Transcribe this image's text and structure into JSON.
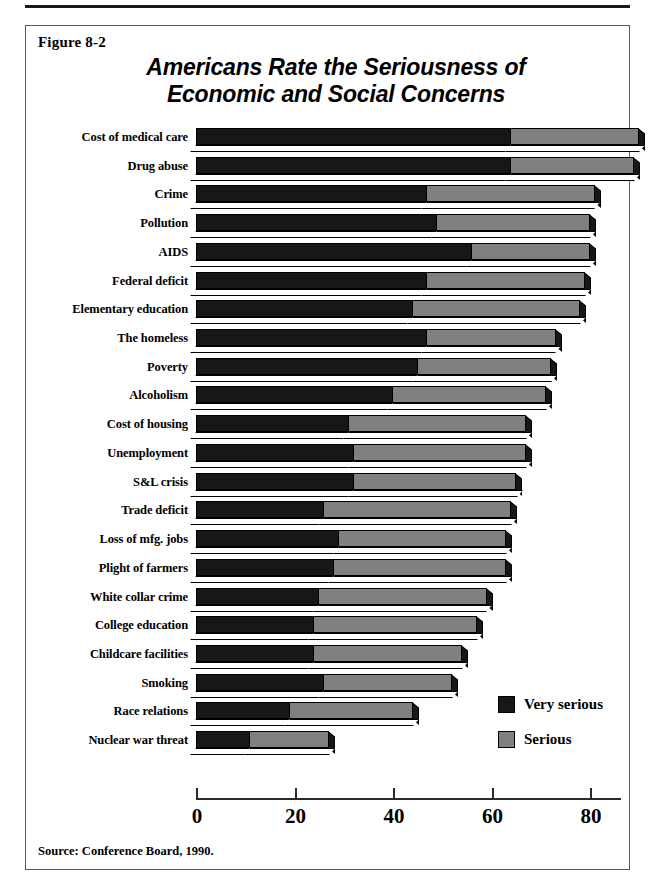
{
  "figure": {
    "number": "Figure 8-2",
    "title_line1": "Americans Rate the Seriousness of",
    "title_line2": "Economic and Social Concerns",
    "source": "Source: Conference Board, 1990."
  },
  "legend": {
    "items": [
      {
        "label": "Very serious",
        "color": "#171717",
        "key": "very_serious"
      },
      {
        "label": "Serious",
        "color": "#808080",
        "key": "serious"
      }
    ]
  },
  "axis": {
    "ticks": [
      0,
      20,
      40,
      60,
      80
    ],
    "tick_labels": [
      "0",
      "20",
      "40",
      "60",
      "80"
    ],
    "min": 0,
    "max": 90
  },
  "chart_data": {
    "type": "bar",
    "orientation": "horizontal",
    "stacked": true,
    "title": "Americans Rate the Seriousness of Economic and Social Concerns",
    "xlabel": "",
    "ylabel": "",
    "xlim": [
      0,
      90
    ],
    "grid": false,
    "legend_position": "bottom-right",
    "value_unit": "percent",
    "categories": [
      "Cost of medical care",
      "Drug abuse",
      "Crime",
      "Pollution",
      "AIDS",
      "Federal deficit",
      "Elementary education",
      "The homeless",
      "Poverty",
      "Alcoholism",
      "Cost of housing",
      "Unemployment",
      "S&L crisis",
      "Trade deficit",
      "Loss of mfg. jobs",
      "Plight of farmers",
      "White collar crime",
      "College education",
      "Childcare facilities",
      "Smoking",
      "Race relations",
      "Nuclear war threat"
    ],
    "series": [
      {
        "name": "Very serious",
        "color": "#171717",
        "values": [
          64,
          64,
          47,
          49,
          56,
          47,
          44,
          47,
          45,
          40,
          31,
          32,
          32,
          26,
          29,
          28,
          25,
          24,
          24,
          26,
          19,
          11
        ]
      },
      {
        "name": "Serious",
        "color": "#808080",
        "values": [
          26,
          25,
          34,
          31,
          24,
          32,
          34,
          26,
          27,
          31,
          36,
          35,
          33,
          38,
          34,
          35,
          34,
          33,
          30,
          26,
          25,
          16
        ]
      }
    ],
    "totals": [
      90,
      89,
      81,
      80,
      80,
      79,
      78,
      73,
      72,
      71,
      67,
      67,
      65,
      64,
      63,
      63,
      59,
      57,
      54,
      52,
      44,
      27
    ],
    "source": "Conference Board, 1990."
  }
}
